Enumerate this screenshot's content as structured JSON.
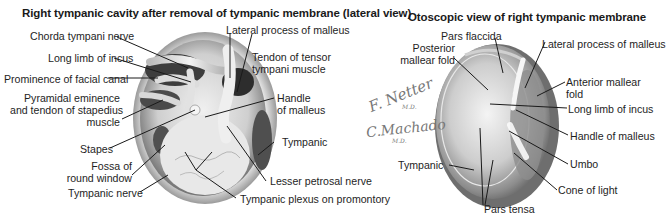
{
  "left_panel": {
    "title": "Right tympanic cavity after removal of tympanic membrane (lateral view)",
    "labels": {
      "chorda_tympani": "Chorda tympani nerve",
      "long_limb_incus": "Long limb of incus",
      "prominence_facial": "Prominence of facial canal",
      "pyramidal_1": "Pyramidal eminence",
      "pyramidal_2": "and tendon of stapedius",
      "pyramidal_3": "muscle",
      "stapes": "Stapes",
      "fossa_1": "Fossa of",
      "fossa_2": "round window",
      "tympanic_nerve": "Tympanic nerve",
      "lateral_process": "Lateral process of malleus",
      "tendon_tensor_1": "Tendon of tensor",
      "tendon_tensor_2": "tympani muscle",
      "handle_1": "Handle",
      "handle_2": "of malleus",
      "tympanic": "Tympanic",
      "lesser_petrosal": "Lesser petrosal nerve",
      "tympanic_plexus": "Tympanic plexus on promontory"
    }
  },
  "right_panel": {
    "title": "Otoscopic view of right tympanic membrane",
    "labels": {
      "pars_flaccida": "Pars flaccida",
      "posterior_fold_1": "Posterior",
      "posterior_fold_2": "mallear fold",
      "lateral_process": "Lateral process of malleus",
      "anterior_fold_1": "Anterior mallear",
      "anterior_fold_2": "fold",
      "long_limb_incus": "Long limb of incus",
      "handle_malleus": "Handle of malleus",
      "umbo": "Umbo",
      "cone_of_light": "Cone of light",
      "tympanic": "Tympanic",
      "pars_tensa": "Pars tensa"
    }
  },
  "signatures": {
    "netter": "F. Netter",
    "netter_md": "M.D.",
    "machado": "C.Machado",
    "machado_md": "M.D."
  },
  "colors": {
    "leader_line": "#1a1a1a",
    "illustration_tone": "#8a8a8a"
  }
}
